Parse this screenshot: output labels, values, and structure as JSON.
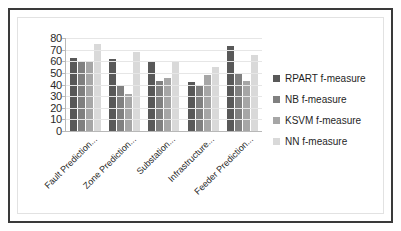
{
  "chart_data": {
    "type": "bar",
    "title": "",
    "subtitle": "",
    "xlabel": "",
    "ylabel": "",
    "ylim": [
      0,
      80
    ],
    "yticks": [
      0,
      10,
      20,
      30,
      40,
      50,
      60,
      70,
      80
    ],
    "ytick_labels": [
      "0",
      "10",
      "20",
      "30",
      "40",
      "50",
      "60",
      "70",
      "80"
    ],
    "grid": true,
    "grid_axis": "y",
    "legend_position": "right",
    "categories": [
      "Fault Prediction...",
      "Zone Prediction...",
      "Substation...",
      "Infrastructure...",
      "Feeder Prediction..."
    ],
    "series": [
      {
        "name": "RPART f-measure",
        "color": "#595959",
        "values": [
          63,
          62,
          59,
          42,
          73
        ]
      },
      {
        "name": "NB f-measure",
        "color": "#808080",
        "values": [
          59,
          40,
          43,
          40,
          49
        ]
      },
      {
        "name": "KSVM f-measure",
        "color": "#a6a6a6",
        "values": [
          60,
          32,
          46,
          48,
          43
        ]
      },
      {
        "name": "NN f-measure",
        "color": "#d9d9d9",
        "values": [
          75,
          68,
          59,
          55,
          65
        ]
      }
    ]
  },
  "colors": {
    "frame_outer": "#3a3a3a",
    "frame_inner": "#e2e2e2",
    "axis": "#b8b8b8",
    "gridline": "#e6e6e6",
    "text": "#1f1f1f",
    "background": "#ffffff"
  }
}
